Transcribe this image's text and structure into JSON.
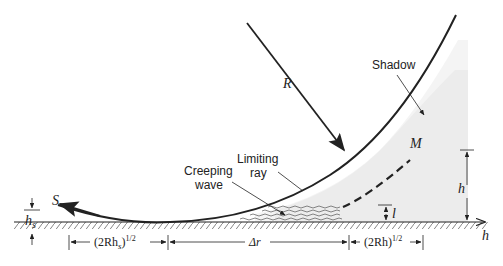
{
  "labels": {
    "R": "R",
    "shadow": "Shadow",
    "limiting_ray_1": "Limiting",
    "limiting_ray_2": "ray",
    "creeping_1": "Creeping",
    "creeping_2": "wave",
    "M": "M",
    "S": "S",
    "h_right": "h",
    "h_axis": "h",
    "l": "l",
    "hs_main": "h",
    "hs_sub": "s"
  },
  "dimensions": {
    "left": {
      "pre": "(2Rh",
      "sub": "s",
      "post": ")",
      "sup": "1/2"
    },
    "middle": {
      "text": "Δr"
    },
    "right": {
      "pre": "(2Rh)",
      "sup": "1/2"
    }
  },
  "colors": {
    "line": "#222222",
    "shadow_fill": "#e9e9e9",
    "hatch": "#555555"
  }
}
